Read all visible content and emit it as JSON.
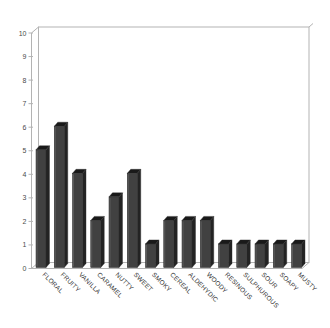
{
  "chart_data": {
    "type": "bar",
    "style": "3d-column",
    "title": "",
    "xlabel": "",
    "ylabel": "",
    "categories": [
      "FLORAL",
      "FRUITY",
      "VANILLA",
      "CARAMEL",
      "NUTTY",
      "SWEET",
      "SMOKY",
      "CEREAL",
      "ALDEHYDIC",
      "WOODY",
      "RESINOUS",
      "SULPHUROUS",
      "SOUR",
      "SOAPY",
      "MUSTY"
    ],
    "values": [
      5,
      6,
      4,
      2,
      3,
      4,
      1,
      2,
      2,
      2,
      1,
      1,
      1,
      1,
      1
    ],
    "ylim": [
      0,
      10
    ],
    "yticks": [
      0,
      1,
      2,
      3,
      4,
      5,
      6,
      7,
      8,
      9,
      10
    ],
    "grid": false,
    "legend": false,
    "category_label_rotation_deg": 45,
    "colors": {
      "background": "#ffffff",
      "wall_fill": "#ffffff",
      "wall_border": "#b3b3b3",
      "floor_fill": "#fdfdfd",
      "bar_front": "#414141",
      "bar_side": "#232323",
      "bar_top": "#191919",
      "bar_outline": "#2a2a2a",
      "tick_text": "#4a4a4a",
      "category_text": "#333333"
    }
  }
}
